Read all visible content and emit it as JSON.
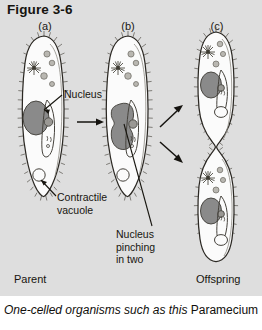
{
  "figure": {
    "title": "Figure 3-6",
    "background_color": "#dedede",
    "page_color": "#ffffff",
    "ink_color": "#17150f",
    "nucleus_color": "#8a8a8a",
    "cell_fill_color": "#fbfbfb"
  },
  "panels": [
    {
      "id": "a",
      "label": "(a)",
      "end_label": "Parent"
    },
    {
      "id": "b",
      "label": "(b)",
      "end_label": ""
    },
    {
      "id": "c",
      "label": "(c)",
      "end_label": "Offspring"
    }
  ],
  "panel_labels": {
    "a": "(a)",
    "b": "(b)",
    "c": "(c)"
  },
  "callouts": {
    "nucleus": "Nucleus",
    "contractile_vacuole": "Contractile\nvacuole",
    "nucleus_pinching": "Nucleus\npinching\nin two"
  },
  "stage_labels": {
    "parent": "Parent",
    "offspring": "Offspring"
  },
  "caption": {
    "italic_part": "One-celled organisms such as this ",
    "roman_part": "Paramecium"
  },
  "organelles": {
    "macronucleus": "macronucleus",
    "contractile_vacuole": "contractile-vacuole",
    "food_vacuole": "food-vacuole",
    "oral_groove": "oral-groove",
    "cilia": "cilia"
  },
  "arrows": {
    "a_to_b": "single-right-arrow",
    "b_to_c_upper": "diverging-arrow-up",
    "b_to_c_lower": "diverging-arrow-down"
  }
}
